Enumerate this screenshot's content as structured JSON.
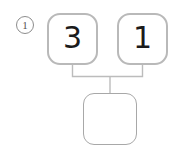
{
  "worksheet": {
    "problem_marker": "1",
    "marker_shape": "circled-number"
  },
  "diagram": {
    "type": "number-bond",
    "parts": [
      {
        "label": "3",
        "position": "left"
      },
      {
        "label": "1",
        "position": "right"
      }
    ],
    "whole": {
      "label": "",
      "state": "empty"
    },
    "connector": {
      "style": "bracket",
      "shape": "inverted-u-with-stem"
    }
  },
  "colors": {
    "part_border": "#b9b9b9",
    "whole_border": "#a8a8a8",
    "connector": "#bcbcbc",
    "digit": "#1b1b1b",
    "marker": "#8d8d8d",
    "background": "#ffffff"
  }
}
